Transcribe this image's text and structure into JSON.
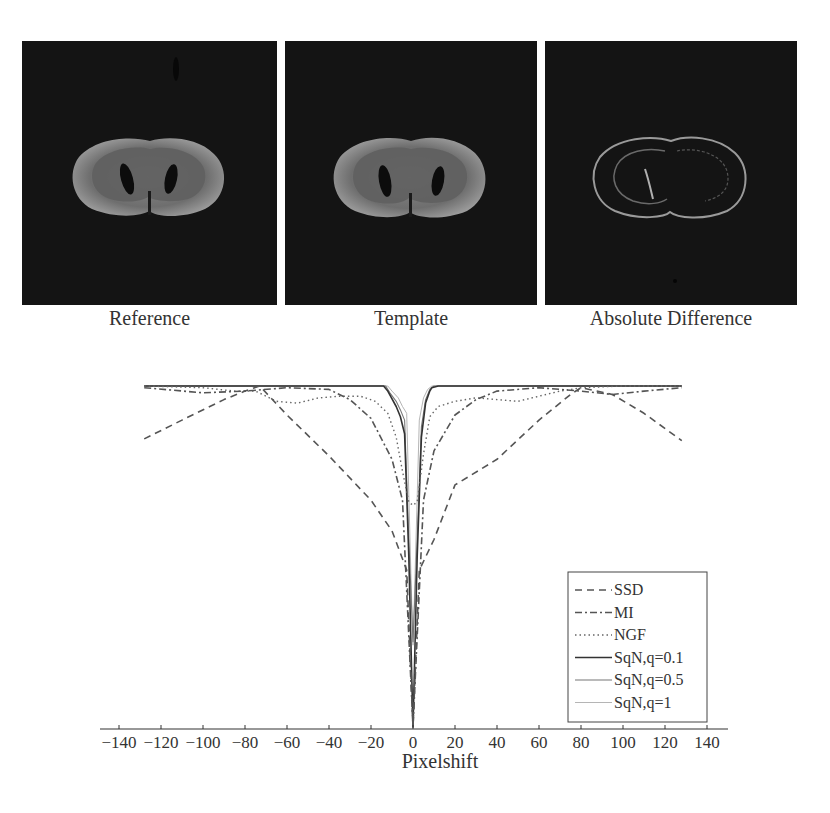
{
  "figure": {
    "panels": [
      {
        "caption": "Reference",
        "kind": "brain-slice"
      },
      {
        "caption": "Template",
        "kind": "brain-slice"
      },
      {
        "caption": "Absolute Difference",
        "kind": "difference-image"
      }
    ]
  },
  "chart_data": {
    "type": "line",
    "title": "",
    "xlabel": "Pixelshift",
    "ylabel": "",
    "xlim": [
      -150,
      150
    ],
    "ylim": [
      0,
      1
    ],
    "xticks": [
      -140,
      -120,
      -100,
      -80,
      -60,
      -40,
      -20,
      0,
      20,
      40,
      60,
      80,
      100,
      120,
      140
    ],
    "grid": false,
    "legend_position": "lower right",
    "series": [
      {
        "name": "SSD",
        "style": "dashed",
        "width": 1.6,
        "color": "#555555",
        "x": [
          -128,
          -110,
          -90,
          -80,
          -73,
          -60,
          -40,
          -20,
          -10,
          -3,
          0,
          3,
          10,
          20,
          40,
          60,
          75,
          80,
          95,
          110,
          128
        ],
        "y": [
          0.845,
          0.9,
          0.96,
          0.985,
          1.0,
          0.915,
          0.795,
          0.665,
          0.575,
          0.46,
          0.0,
          0.46,
          0.55,
          0.71,
          0.785,
          0.9,
          0.975,
          0.995,
          0.975,
          0.92,
          0.84
        ]
      },
      {
        "name": "MI",
        "style": "dashdot",
        "width": 1.6,
        "color": "#555555",
        "x": [
          -128,
          -100,
          -80,
          -60,
          -40,
          -30,
          -20,
          -10,
          -5,
          0,
          5,
          10,
          20,
          30,
          40,
          60,
          80,
          95,
          110,
          128
        ],
        "y": [
          0.995,
          0.98,
          0.985,
          0.995,
          0.99,
          0.96,
          0.905,
          0.785,
          0.665,
          0.0,
          0.665,
          0.81,
          0.915,
          0.96,
          0.985,
          0.995,
          0.985,
          0.975,
          0.985,
          0.995
        ]
      },
      {
        "name": "NGF",
        "style": "dotted",
        "width": 1.4,
        "color": "#666666",
        "x": [
          -128,
          -100,
          -85,
          -75,
          -65,
          -55,
          -45,
          -35,
          -25,
          -18,
          -12,
          -8,
          -5,
          -2,
          0,
          2,
          5,
          8,
          12,
          20,
          30,
          40,
          50,
          60,
          70,
          80,
          100,
          128
        ],
        "y": [
          1.0,
          0.995,
          0.985,
          0.985,
          0.955,
          0.95,
          0.965,
          0.97,
          0.97,
          0.955,
          0.92,
          0.85,
          0.75,
          0.66,
          0.65,
          0.66,
          0.8,
          0.91,
          0.94,
          0.955,
          0.965,
          0.96,
          0.955,
          0.97,
          0.985,
          0.995,
          1.0,
          1.0
        ]
      },
      {
        "name": "SqN,q=0.1",
        "style": "solid",
        "width": 1.6,
        "color": "#333333",
        "x": [
          -128,
          -14,
          -12,
          -8,
          -6,
          -4,
          -2,
          0,
          2,
          4,
          6,
          8,
          9,
          12,
          128
        ],
        "y": [
          1.0,
          1.0,
          0.985,
          0.94,
          0.91,
          0.86,
          0.5,
          0.0,
          0.5,
          0.85,
          0.95,
          0.985,
          0.995,
          1.0,
          1.0
        ]
      },
      {
        "name": "SqN,q=0.5",
        "style": "solid",
        "width": 1.1,
        "color": "#777777",
        "x": [
          -128,
          -13,
          -11,
          -8,
          -6,
          -4,
          -2,
          0,
          2,
          4,
          6,
          8,
          10,
          128
        ],
        "y": [
          1.0,
          1.0,
          0.98,
          0.955,
          0.93,
          0.9,
          0.55,
          0.25,
          0.55,
          0.88,
          0.96,
          0.99,
          1.0,
          1.0
        ]
      },
      {
        "name": "SqN,q=1",
        "style": "solid",
        "width": 1.0,
        "color": "#b5b5b5",
        "x": [
          -128,
          -12,
          -10,
          -7,
          -5,
          -3,
          -1,
          0,
          1,
          3,
          5,
          7,
          9,
          128
        ],
        "y": [
          1.0,
          1.0,
          0.985,
          0.965,
          0.94,
          0.92,
          0.45,
          0.24,
          0.45,
          0.9,
          0.965,
          0.99,
          1.0,
          1.0
        ]
      }
    ]
  }
}
